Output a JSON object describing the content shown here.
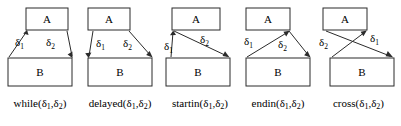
{
  "figure": {
    "background": "#ffffff",
    "stroke_color": "#2b2b2b",
    "text_color": "#000000",
    "box_top_label": "A",
    "box_bottom_label": "B",
    "delta": "δ",
    "sub1": "1",
    "sub2": "2",
    "open_paren": "(",
    "comma": ",",
    "close_paren": ")"
  },
  "panels": [
    {
      "id": "while",
      "name": "while",
      "caption_prefix": "while",
      "label1": "δ",
      "label1_sub": "1",
      "label2": "δ",
      "label2_sub": "2",
      "arrow1_direction": "up-right",
      "arrow2_direction": "down-right",
      "description": "A starts after B starts and ends before B ends"
    },
    {
      "id": "delayed",
      "name": "delayed",
      "caption_prefix": "delayed",
      "label1": "δ",
      "label1_sub": "1",
      "label2": "δ",
      "label2_sub": "2",
      "arrow1_direction": "down-left",
      "arrow2_direction": "down-right",
      "description": "A starts before B starts and ends before B ends"
    },
    {
      "id": "startin",
      "name": "startin",
      "caption_prefix": "startin",
      "label1": "δ",
      "label1_sub": "1",
      "label2": "δ",
      "label2_sub": "2",
      "arrow1_direction": "up",
      "arrow2_direction": "down-right",
      "description": "A starts together with B and ends before B ends"
    },
    {
      "id": "endin",
      "name": "endin",
      "caption_prefix": "endin",
      "label1": "δ",
      "label1_sub": "1",
      "label2": "δ",
      "label2_sub": "2",
      "arrow1_direction": "up-right",
      "arrow2_direction": "down-right",
      "description": "A starts after B starts and ends together with B"
    },
    {
      "id": "cross",
      "name": "cross",
      "caption_prefix": "cross",
      "label1": "δ",
      "label1_sub": "1",
      "label2": "δ",
      "label2_sub": "2",
      "arrow1_direction": "down-right",
      "arrow2_direction": "up-right",
      "description": "Arrows cross: A ends after B starts, offsets reversed"
    }
  ]
}
